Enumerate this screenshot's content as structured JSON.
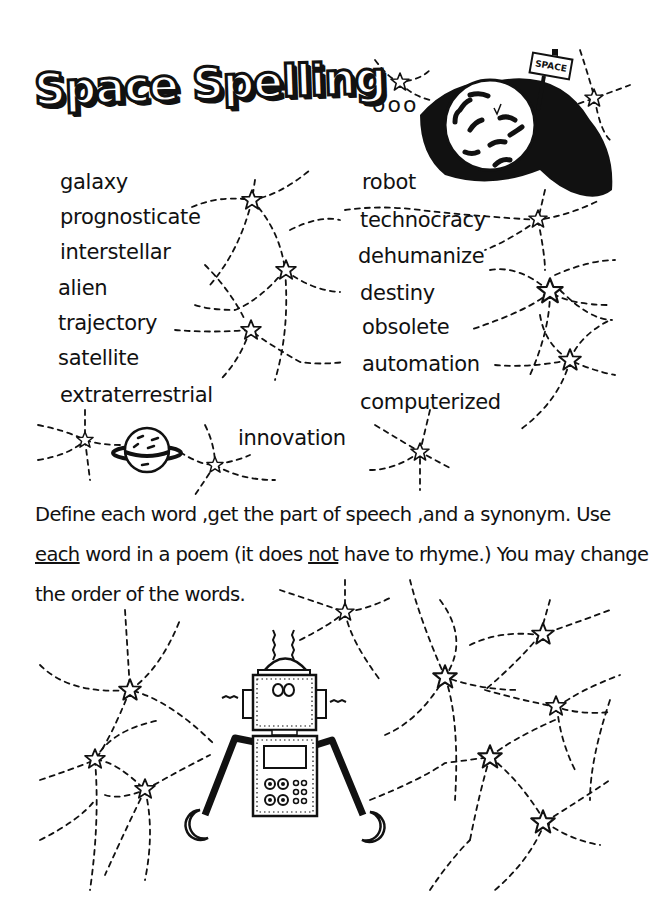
{
  "worksheet": {
    "title": "Space Spelling",
    "title_ellipsis": "ooo",
    "planet_sign": "SPACE",
    "words_left": [
      "galaxy",
      "prognosticate",
      "interstellar",
      "alien",
      "trajectory",
      "satellite",
      "extraterrestrial"
    ],
    "words_right": [
      "robot",
      "technocracy",
      "dehumanize",
      "destiny",
      "obsolete",
      "automation",
      "computerized"
    ],
    "word_extra": "innovation",
    "instructions": {
      "line1": "Define each word ,get the part of speech ,and a synonym. Use",
      "line2_a": "each",
      "line2_b": " word in a poem (it does ",
      "line2_c": "not",
      "line2_d": " have to rhyme.) You may change",
      "line3": "the order of the words."
    },
    "illustrations": [
      "planet-with-sign",
      "ringed-planet",
      "robot",
      "constellation-stars"
    ]
  }
}
